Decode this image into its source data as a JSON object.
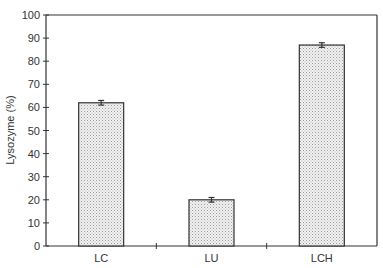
{
  "chart_data": {
    "type": "bar",
    "title": "",
    "xlabel": "",
    "ylabel": "Lysozyme (%)",
    "ylim": [
      0,
      100
    ],
    "yticks": [
      0,
      10,
      20,
      30,
      40,
      50,
      60,
      70,
      80,
      90,
      100
    ],
    "categories": [
      "LC",
      "LU",
      "LCH"
    ],
    "values": [
      62,
      20,
      87
    ],
    "error": [
      1,
      1,
      1
    ],
    "grid": false,
    "legend": null,
    "bar_fill": "dotted light gray",
    "colors": {
      "bar_fill": "#e6e6e6",
      "bar_stroke": "#333333",
      "axis": "#333333"
    }
  }
}
